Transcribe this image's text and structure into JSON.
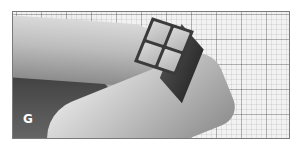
{
  "image": {
    "description": "Grayscale photo of a hand holding a tiny 2x2 puzzle cube over grid paper",
    "overlay_letter": "G",
    "colors": {
      "frame_border": "#7a7a7a",
      "page_background": "#ffffff",
      "overlay_letter": "#ffffff"
    }
  }
}
